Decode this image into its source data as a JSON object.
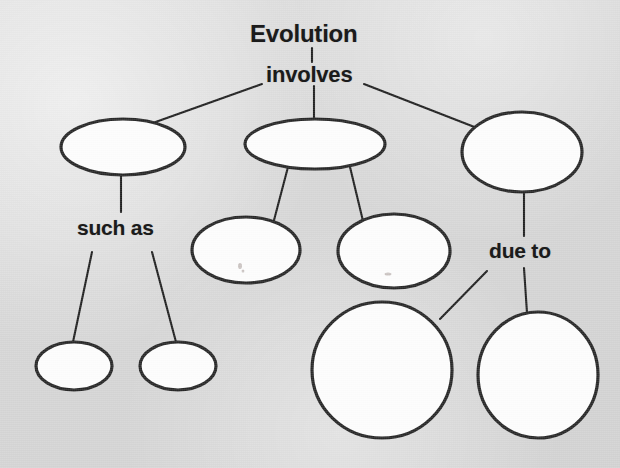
{
  "diagram": {
    "type": "concept-map",
    "title": "Evolution",
    "background_color": "#d9d9d9",
    "node_fill_color": "#fdfdfd",
    "node_stroke_color": "#262626",
    "connector_color": "#1f1f1f",
    "text_color": "#1b1b1b",
    "labels": [
      {
        "id": "evolution",
        "text": "Evolution",
        "role": "root-concept"
      },
      {
        "id": "involves",
        "text": "involves",
        "role": "linking-phrase"
      },
      {
        "id": "such_as",
        "text": "such as",
        "role": "linking-phrase"
      },
      {
        "id": "due_to",
        "text": "due to",
        "role": "linking-phrase"
      }
    ],
    "nodes": [
      {
        "id": "node-left-top",
        "shape": "ellipse",
        "label": "",
        "cx": 123,
        "cy": 147,
        "rx": 62,
        "ry": 28
      },
      {
        "id": "node-center-top",
        "shape": "ellipse",
        "label": "",
        "cx": 315,
        "cy": 144,
        "rx": 70,
        "ry": 25
      },
      {
        "id": "node-right-top",
        "shape": "ellipse",
        "label": "",
        "cx": 522,
        "cy": 152,
        "rx": 60,
        "ry": 40
      },
      {
        "id": "node-center-mid-left",
        "shape": "ellipse",
        "label": "",
        "cx": 246,
        "cy": 250,
        "rx": 54,
        "ry": 33
      },
      {
        "id": "node-center-mid-right",
        "shape": "ellipse",
        "label": "",
        "cx": 394,
        "cy": 251,
        "rx": 56,
        "ry": 37
      },
      {
        "id": "node-bottom-left-1",
        "shape": "ellipse",
        "label": "",
        "cx": 74,
        "cy": 366,
        "rx": 38,
        "ry": 24
      },
      {
        "id": "node-bottom-left-2",
        "shape": "ellipse",
        "label": "",
        "cx": 178,
        "cy": 366,
        "rx": 38,
        "ry": 24
      },
      {
        "id": "node-bottom-center",
        "shape": "circle",
        "label": "",
        "cx": 382,
        "cy": 370,
        "rx": 70,
        "ry": 68
      },
      {
        "id": "node-bottom-right",
        "shape": "circle",
        "label": "",
        "cx": 538,
        "cy": 375,
        "rx": 60,
        "ry": 63
      }
    ],
    "connections": [
      {
        "from": "evolution",
        "to": "involves",
        "style": "vertical"
      },
      {
        "from": "involves",
        "to": "node-left-top",
        "style": "diagonal"
      },
      {
        "from": "involves",
        "to": "node-center-top",
        "style": "vertical"
      },
      {
        "from": "involves",
        "to": "node-right-top",
        "style": "diagonal"
      },
      {
        "from": "node-left-top",
        "to": "such_as",
        "style": "vertical"
      },
      {
        "from": "such_as",
        "to": "node-bottom-left-1",
        "style": "diagonal"
      },
      {
        "from": "such_as",
        "to": "node-bottom-left-2",
        "style": "diagonal"
      },
      {
        "from": "node-center-top",
        "to": "node-center-mid-left",
        "style": "diagonal"
      },
      {
        "from": "node-center-top",
        "to": "node-center-mid-right",
        "style": "diagonal"
      },
      {
        "from": "node-right-top",
        "to": "due_to",
        "style": "vertical"
      },
      {
        "from": "due_to",
        "to": "node-bottom-center",
        "style": "diagonal"
      },
      {
        "from": "due_to",
        "to": "node-bottom-right",
        "style": "vertical"
      }
    ]
  }
}
